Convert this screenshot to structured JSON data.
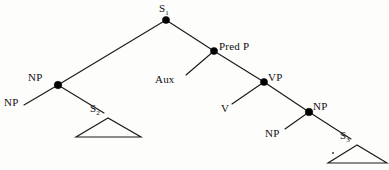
{
  "diagram": {
    "type": "syntax-tree",
    "background_color": "#fdfdfb",
    "line_color": "#1a1a1a",
    "node_color": "#000000",
    "labels": {
      "root": "S",
      "root_sub": "1",
      "subject_np_node": "NP",
      "subject_np_terminal": "NP",
      "embedded_s2": "S",
      "embedded_s2_sub": "2",
      "pred_phrase": "Pred P",
      "aux": "Aux",
      "verb_phrase": "VP",
      "verb": "V",
      "object_np_node": "NP",
      "object_np_terminal": "NP",
      "embedded_s3": "S",
      "embedded_s3_sub": "3"
    },
    "nodes": [
      {
        "id": "s1",
        "label": "S1",
        "x": 166,
        "y": 20,
        "dot": true
      },
      {
        "id": "np-subj",
        "label": "NP",
        "x": 58,
        "y": 85,
        "dot": true
      },
      {
        "id": "predp",
        "label": "Pred P",
        "x": 214,
        "y": 51,
        "dot": true
      },
      {
        "id": "vp",
        "label": "VP",
        "x": 264,
        "y": 82,
        "dot": true
      },
      {
        "id": "np-obj",
        "label": "NP",
        "x": 309,
        "y": 112,
        "dot": true
      }
    ],
    "terminals": [
      {
        "id": "np-left",
        "label": "NP",
        "x": 14,
        "y": 103
      },
      {
        "id": "s2",
        "label": "S2",
        "x": 98,
        "y": 110
      },
      {
        "id": "aux",
        "label": "Aux",
        "x": 170,
        "y": 80
      },
      {
        "id": "v",
        "label": "V",
        "x": 226,
        "y": 109
      },
      {
        "id": "np-lower",
        "label": "NP",
        "x": 275,
        "y": 134
      },
      {
        "id": "s3",
        "label": "S3",
        "x": 347,
        "y": 137
      }
    ],
    "triangles": [
      {
        "id": "tri-s2",
        "apex_x": 108,
        "apex_y": 118,
        "left_x": 76,
        "right_x": 141,
        "base_y": 137
      },
      {
        "id": "tri-s3",
        "apex_x": 357,
        "apex_y": 145,
        "left_x": 328,
        "right_x": 387,
        "base_y": 163
      }
    ]
  }
}
